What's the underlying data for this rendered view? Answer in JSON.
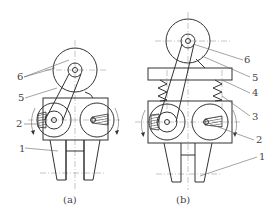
{
  "figure": {
    "subfigures": [
      {
        "id": "a",
        "caption": "(a)",
        "labels": [
          {
            "text": "6",
            "x": 20,
            "y": 80
          },
          {
            "text": "5",
            "x": 21,
            "y": 101
          },
          {
            "text": "2",
            "x": 18,
            "y": 126
          },
          {
            "text": "1",
            "x": 21,
            "y": 151
          }
        ]
      },
      {
        "id": "b",
        "caption": "(b)",
        "labels": [
          {
            "text": "6",
            "x": 245,
            "y": 62
          },
          {
            "text": "5",
            "x": 252,
            "y": 80
          },
          {
            "text": "4",
            "x": 252,
            "y": 95
          },
          {
            "text": "3",
            "x": 252,
            "y": 119
          },
          {
            "text": "2",
            "x": 256,
            "y": 143
          },
          {
            "text": "1",
            "x": 259,
            "y": 159
          }
        ]
      }
    ],
    "colors": {
      "line": "#333333",
      "background": "#ffffff"
    }
  }
}
